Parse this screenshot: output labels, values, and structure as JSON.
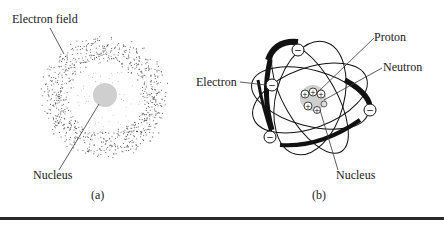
{
  "diagram_a": {
    "labels": {
      "electron_field": "Electron field",
      "nucleus": "Nucleus"
    },
    "caption": "(a)"
  },
  "diagram_b": {
    "labels": {
      "proton": "Proton",
      "neutron": "Neutron",
      "electron": "Electron",
      "nucleus": "Nucleus"
    },
    "caption": "(b)",
    "electron_symbol": "−",
    "proton_symbol": "+"
  },
  "colors": {
    "ink": "#1a1a1a",
    "nucleus_fill": "#cfcfcf",
    "cloud_dot": "#555555",
    "rule": "#2a2a2a"
  }
}
